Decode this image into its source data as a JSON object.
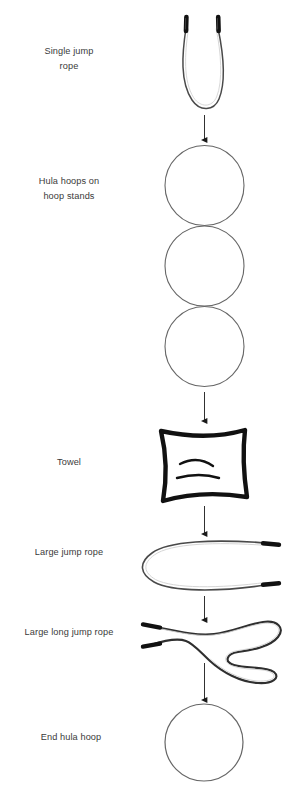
{
  "diagram": {
    "background_color": "#ffffff",
    "label_color": "#3a3a3a",
    "stroke_color": "#555555",
    "ink_color": "#111111",
    "steps": [
      {
        "id": "single-jump-rope",
        "label": "Single jump\nrope",
        "icon": "jump-rope-icon"
      },
      {
        "id": "hula-hoops-on-hoop-stands",
        "label": "Hula hoops on\nhoop stands",
        "icon": "hula-hoop-stack-icon"
      },
      {
        "id": "towel",
        "label": "Towel",
        "icon": "towel-icon"
      },
      {
        "id": "large-jump-rope",
        "label": "Large jump rope",
        "icon": "large-jump-rope-icon"
      },
      {
        "id": "large-long-jump-rope",
        "label": "Large long jump rope",
        "icon": "large-long-jump-rope-icon"
      },
      {
        "id": "end-hula-hoop",
        "label": "End hula hoop",
        "icon": "hula-hoop-icon"
      }
    ],
    "connectors": [
      {
        "id": "arrow-1",
        "from": "single-jump-rope",
        "to": "hula-hoops-on-hoop-stands"
      },
      {
        "id": "arrow-2",
        "from": "hula-hoops-on-hoop-stands",
        "to": "towel"
      },
      {
        "id": "arrow-3",
        "from": "towel",
        "to": "large-jump-rope"
      },
      {
        "id": "arrow-4",
        "from": "large-jump-rope",
        "to": "large-long-jump-rope"
      },
      {
        "id": "arrow-5",
        "from": "large-long-jump-rope",
        "to": "end-hula-hoop"
      }
    ]
  }
}
